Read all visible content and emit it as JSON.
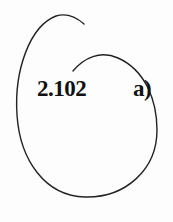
{
  "figure": {
    "number": "2.102",
    "part": "a)",
    "stroke_color": "#222222",
    "background": "#fdfdfd"
  }
}
